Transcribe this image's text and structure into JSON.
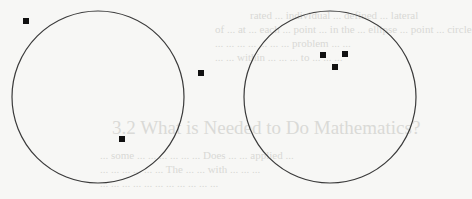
{
  "figure": {
    "circles": [
      {
        "id": "left",
        "cx": 98,
        "cy": 97,
        "r": 86
      },
      {
        "id": "right",
        "cx": 330,
        "cy": 97,
        "r": 86
      }
    ],
    "points": {
      "left": [
        {
          "x": 26,
          "y": 21
        },
        {
          "x": 201,
          "y": 73
        },
        {
          "x": 122,
          "y": 139
        }
      ],
      "right": [
        {
          "x": 323,
          "y": 55
        },
        {
          "x": 345,
          "y": 54
        },
        {
          "x": 335,
          "y": 67
        }
      ]
    },
    "stroke_color": "#3a3a3a",
    "point_color": "#111111",
    "point_size": 6
  },
  "bleed_through": {
    "lines_top": [
      "rated ... individual ... defined ... lateral",
      "of ... at ... each ... point ... in the ... ellipse ... point ... circle",
      "... ... ... ... ... ... ... problem ... ...",
      "... ... within ... ... ... to ... ... ..."
    ],
    "heading": "3.2  What is Needed to Do Mathematics?",
    "lines_bottom": [
      "... some ... ... ... ... ... ... Does ... ... applied ...",
      "... ... ... ... ... ... The ... ... with ... ... ...",
      "... ... ... ... ... ... ... ... ... ... ..."
    ]
  }
}
